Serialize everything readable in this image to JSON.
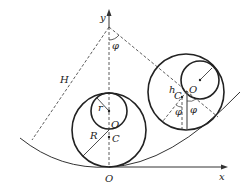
{
  "diagram": {
    "labels": {
      "y_axis": "y",
      "x_axis": "x",
      "origin": "O",
      "pivot_angle": "φ",
      "length": "H",
      "small_radius": "r",
      "large_radius": "R",
      "center_left_O": "O",
      "center_left_C": "C",
      "center_right_O": "O",
      "center_right_C": "C",
      "offset_h": "h",
      "angle_right_1": "φ",
      "angle_right_2": "φ"
    },
    "colors": {
      "stroke": "#222222",
      "background": "#ffffff"
    }
  }
}
